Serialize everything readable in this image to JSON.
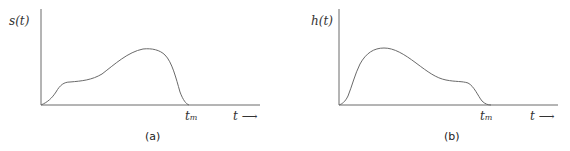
{
  "panels": [
    {
      "caption": "(a)",
      "ylabel": "s(t)",
      "tick_label": "t",
      "tick_sub": "m",
      "xlabel": "t",
      "arrow": "⟶",
      "description": "Signal with small shoulder early and larger peak late, ending at t_m"
    },
    {
      "caption": "(b)",
      "ylabel": "h(t)",
      "tick_label": "t",
      "tick_sub": "m",
      "xlabel": "t",
      "arrow": "⟶",
      "description": "Time-reversed version: large peak early and small shoulder late, ending at t_m"
    }
  ],
  "colors": {
    "line": "#6a6a6a",
    "text": "#333333"
  }
}
